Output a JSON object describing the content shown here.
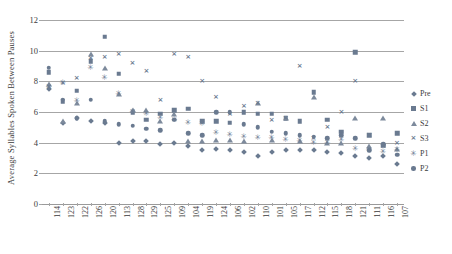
{
  "chart_data": {
    "type": "scatter",
    "title": "",
    "xlabel": "",
    "ylabel": "Average Syllables Spoken Between Pauses",
    "ylim": [
      0,
      12
    ],
    "ytick_values": [
      0,
      2,
      4,
      6,
      8,
      10,
      12
    ],
    "ytick_labels": [
      "0",
      "2",
      "4",
      "6",
      "8",
      "10",
      "12"
    ],
    "grid": true,
    "legend_position": "right",
    "categories": [
      "114",
      "123",
      "122",
      "126",
      "120",
      "113",
      "128",
      "129",
      "125",
      "109",
      "104",
      "119",
      "124",
      "106",
      "102",
      "110",
      "101",
      "105",
      "117",
      "112",
      "115",
      "118",
      "121",
      "111",
      "116",
      "107"
    ],
    "series": [
      {
        "name": "Pre",
        "marker": "diamond",
        "color": "#6a7a90",
        "values": [
          7.5,
          5.3,
          5.6,
          5.4,
          5.3,
          4.0,
          4.1,
          4.1,
          3.9,
          4.0,
          3.8,
          3.5,
          3.6,
          3.5,
          3.4,
          3.1,
          3.4,
          3.5,
          3.5,
          3.5,
          3.4,
          3.3,
          3.1,
          3.0,
          3.1,
          2.6
        ]
      },
      {
        "name": "S1",
        "marker": "square",
        "color": "#6a7a90",
        "values": [
          8.6,
          6.7,
          7.4,
          9.3,
          10.9,
          8.5,
          6.0,
          5.5,
          5.9,
          6.1,
          6.2,
          5.4,
          5.4,
          5.3,
          6.0,
          5.9,
          5.9,
          5.6,
          5.4,
          7.3,
          5.5,
          4.7,
          9.9,
          4.5,
          3.8,
          4.6
        ]
      },
      {
        "name": "S2",
        "marker": "triangle",
        "color": "#7d8a9c",
        "values": [
          7.8,
          5.4,
          6.6,
          9.8,
          8.9,
          7.2,
          6.1,
          6.1,
          5.4,
          5.9,
          4.1,
          4.1,
          4.2,
          4.2,
          4.1,
          6.6,
          4.2,
          5.6,
          4.1,
          7.0,
          4.0,
          4.0,
          5.6,
          3.8,
          5.6,
          3.6
        ]
      },
      {
        "name": "S3",
        "marker": "x",
        "color": "#6a7a90",
        "values": [
          7.6,
          7.9,
          8.2,
          9.5,
          9.6,
          9.8,
          9.2,
          8.7,
          6.8,
          9.8,
          9.6,
          8.0,
          7.0,
          5.9,
          6.4,
          6.6,
          5.5,
          5.6,
          9.0,
          4.3,
          5.0,
          6.0,
          8.0,
          4.5,
          3.8,
          4.0
        ]
      },
      {
        "name": "P1",
        "marker": "star",
        "color": "#6a7a90",
        "values": [
          7.6,
          7.9,
          6.7,
          8.9,
          8.2,
          7.2,
          6.0,
          5.9,
          5.6,
          5.5,
          5.3,
          5.2,
          4.6,
          4.5,
          4.4,
          4.3,
          4.3,
          4.2,
          4.1,
          4.0,
          4.0,
          4.2,
          3.6,
          3.5,
          3.4,
          3.5
        ]
      },
      {
        "name": "P2",
        "marker": "circle",
        "color": "#6a7a90",
        "values": [
          8.9,
          6.8,
          5.6,
          6.8,
          5.4,
          5.2,
          5.1,
          4.9,
          4.8,
          5.5,
          4.6,
          4.5,
          6.0,
          6.0,
          5.2,
          5.0,
          4.7,
          4.6,
          4.5,
          4.4,
          4.3,
          4.5,
          4.3,
          3.5,
          3.9,
          3.2
        ]
      }
    ]
  },
  "legend": {
    "entries": [
      {
        "label": "Pre",
        "marker": "diamond"
      },
      {
        "label": "S1",
        "marker": "square"
      },
      {
        "label": "S2",
        "marker": "triangle"
      },
      {
        "label": "S3",
        "marker": "x"
      },
      {
        "label": "P1",
        "marker": "star"
      },
      {
        "label": "P2",
        "marker": "circle"
      }
    ]
  },
  "axis": {
    "y_title": "Average Syllables Spoken Between Pauses"
  }
}
